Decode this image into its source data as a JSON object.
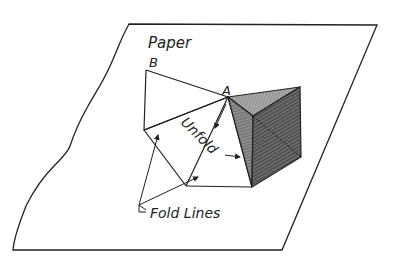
{
  "diagram": {
    "type": "fold-net illustration",
    "labels": {
      "paper": "Paper",
      "point_b": "B",
      "point_a": "A",
      "unfold": "Unfold",
      "fold_lines": "Fold Lines"
    },
    "colors": {
      "line": "#222222",
      "shade_dark": "#555555",
      "shade_mid": "#8a8a8a",
      "shade_light": "#b5b5b5",
      "background": "#ffffff"
    }
  }
}
